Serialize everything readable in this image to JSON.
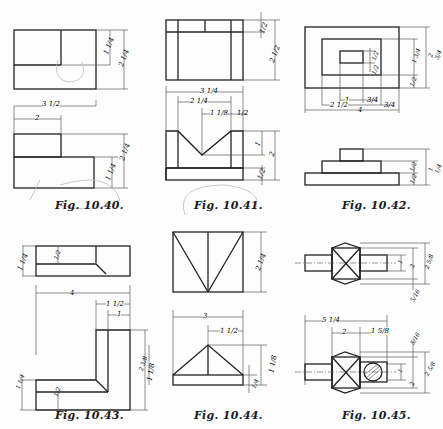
{
  "page": {
    "type": "technical-drawing-exercise-page",
    "background": "#fdfdfd",
    "ink_color": "#222222"
  },
  "figures": [
    {
      "id": "fig-10-40",
      "caption": "Fig. 10.40.",
      "views": [
        "front",
        "top"
      ],
      "dimensions": {
        "top_height_inner": "1 1/4",
        "top_height_total": "2 1/4",
        "width_total": "3 1/2",
        "width_step": "2",
        "front_height_total": "2 1/4",
        "front_height_base": "1 1/4"
      }
    },
    {
      "id": "fig-10-41",
      "caption": "Fig. 10.41.",
      "views": [
        "top",
        "front"
      ],
      "dimensions": {
        "top_strip": "1/2",
        "top_height": "2 1/2",
        "width_total": "3 1/4",
        "width_inner": "2 1/4",
        "v_half": "1 1/8",
        "wall": "1/2",
        "v_depth": "1",
        "height_total": "2",
        "base": "1/2"
      }
    },
    {
      "id": "fig-10-42",
      "caption": "Fig. 10.42.",
      "views": [
        "top",
        "front"
      ],
      "dimensions": {
        "outer_height": "2 3/4",
        "middle_height": "1 3/4",
        "inner_a": "1/2",
        "inner_b": "1/2",
        "bottom_margin": "1/2",
        "hole_width": "1",
        "hole_offset": "3/4",
        "middle_offset": "2 1/2",
        "right_margin": "3/4",
        "width_total": "4",
        "front_total": "1 1/4",
        "front_mid": "1/2",
        "front_low": "1/2"
      }
    },
    {
      "id": "fig-10-43",
      "caption": "Fig. 10.43.",
      "views": [
        "front",
        "top"
      ],
      "dimensions": {
        "front_height": "1 1/4",
        "slot_depth": "1/2",
        "width_total": "4",
        "arm_width": "1 1/2",
        "arm_inner": "1",
        "right_height": "2 3/8",
        "left_height": "1 1/4",
        "base_height": "1/2"
      }
    },
    {
      "id": "fig-10-44",
      "caption": "Fig. 10.44.",
      "views": [
        "top",
        "front"
      ],
      "dimensions": {
        "top_height": "2 1/4",
        "width_total": "3",
        "apex_offset": "1 1/2",
        "height_total": "1 1/8",
        "base": "1/4",
        "left_label": "1 1/8"
      }
    },
    {
      "id": "fig-10-45",
      "caption": "Fig. 10.45.",
      "views": [
        "top",
        "front"
      ],
      "dimensions": {
        "top_shaft": "1",
        "top_body": "2",
        "top_total": "2 5/8",
        "top_chamfer": "5/16",
        "length_total": "5 1/4",
        "body_width": "2",
        "shaft_length": "1 5/8",
        "front_chamfer": "5/16",
        "front_shaft": "1",
        "front_body": "2",
        "front_total": "2 5/8"
      }
    }
  ]
}
